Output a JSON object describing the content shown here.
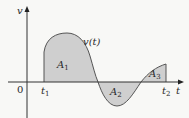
{
  "diagram": {
    "y_axis_label": "v",
    "x_axis_label": "t",
    "origin_label": "0",
    "curve_label": "v(t)",
    "t1_label": "t",
    "t1_sub": "1",
    "t2_label": "t",
    "t2_sub": "2",
    "regions": [
      {
        "label": "A",
        "sub": "1",
        "sign": "positive"
      },
      {
        "label": "A",
        "sub": "2",
        "sign": "negative"
      },
      {
        "label": "A",
        "sub": "3",
        "sign": "positive"
      }
    ],
    "colors": {
      "background": "#f8f8f6",
      "fill": "#cfcfcf",
      "stroke": "#555555",
      "axis": "#333333"
    }
  }
}
